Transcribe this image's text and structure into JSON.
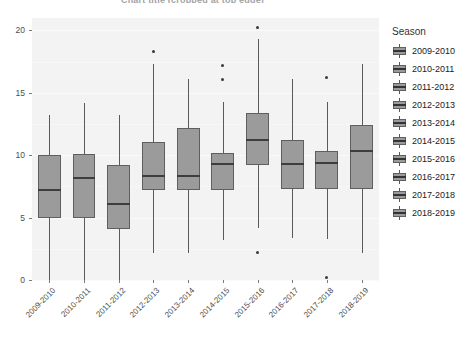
{
  "chart_data": {
    "type": "boxplot",
    "title": "Chart title (cropped at top edge)",
    "xlabel": "",
    "ylabel": "",
    "ylim": [
      0,
      21
    ],
    "yticks": [
      0,
      5,
      10,
      15,
      20
    ],
    "ytick_labels": [
      "0",
      "5",
      "10",
      "15",
      "20"
    ],
    "grid": true,
    "legend_position": "right",
    "legend_title": "Season",
    "categories": [
      "2009-2010",
      "2010-2011",
      "2011-2012",
      "2012-2013",
      "2013-2014",
      "2014-2015",
      "2015-2016",
      "2016-2017",
      "2017-2018",
      "2018-2019"
    ],
    "boxes": [
      {
        "category": "2009-2010",
        "whisker_low": 0.0,
        "q1": 5.0,
        "median": 7.2,
        "q3": 10.0,
        "whisker_high": 13.2,
        "outliers": []
      },
      {
        "category": "2010-2011",
        "whisker_low": 0.0,
        "q1": 5.0,
        "median": 8.2,
        "q3": 10.1,
        "whisker_high": 14.2,
        "outliers": []
      },
      {
        "category": "2011-2012",
        "whisker_low": 0.0,
        "q1": 4.1,
        "median": 6.1,
        "q3": 9.2,
        "whisker_high": 13.2,
        "outliers": []
      },
      {
        "category": "2012-2013",
        "whisker_low": 2.2,
        "q1": 7.2,
        "median": 8.3,
        "q3": 11.1,
        "whisker_high": 17.3,
        "outliers": [
          18.3
        ]
      },
      {
        "category": "2013-2014",
        "whisker_low": 2.2,
        "q1": 7.2,
        "median": 8.3,
        "q3": 12.2,
        "whisker_high": 16.1,
        "outliers": []
      },
      {
        "category": "2014-2015",
        "whisker_low": 3.2,
        "q1": 7.2,
        "median": 9.3,
        "q3": 10.2,
        "whisker_high": 14.3,
        "outliers": [
          17.2,
          16.1
        ]
      },
      {
        "category": "2015-2016",
        "whisker_low": 4.2,
        "q1": 9.2,
        "median": 11.2,
        "q3": 13.4,
        "whisker_high": 19.3,
        "outliers": [
          20.2,
          2.2
        ]
      },
      {
        "category": "2016-2017",
        "whisker_low": 3.4,
        "q1": 7.3,
        "median": 9.3,
        "q3": 11.2,
        "whisker_high": 16.1,
        "outliers": []
      },
      {
        "category": "2017-2018",
        "whisker_low": 3.3,
        "q1": 7.3,
        "median": 9.4,
        "q3": 10.3,
        "whisker_high": 14.3,
        "outliers": [
          16.2,
          0.2
        ]
      },
      {
        "category": "2018-2019",
        "whisker_low": 2.2,
        "q1": 7.3,
        "median": 10.3,
        "q3": 12.4,
        "whisker_high": 17.3,
        "outliers": []
      }
    ],
    "colors": {
      "box_fill": "#9b9b9b",
      "box_border": "#5f5f5f",
      "median": "#3d3d3d",
      "whisker": "#5a5a5a",
      "outlier": "#3a3a3a",
      "panel_background": "#f3f3f3",
      "grid_major": "#fafafa",
      "axis_text": "#4d4d4d"
    }
  },
  "legend": {
    "title": "Season",
    "items": [
      {
        "label": "2009-2010"
      },
      {
        "label": "2010-2011"
      },
      {
        "label": "2011-2012"
      },
      {
        "label": "2012-2013"
      },
      {
        "label": "2013-2014"
      },
      {
        "label": "2014-2015"
      },
      {
        "label": "2015-2016"
      },
      {
        "label": "2016-2017"
      },
      {
        "label": "2017-2018"
      },
      {
        "label": "2018-2019"
      }
    ]
  }
}
